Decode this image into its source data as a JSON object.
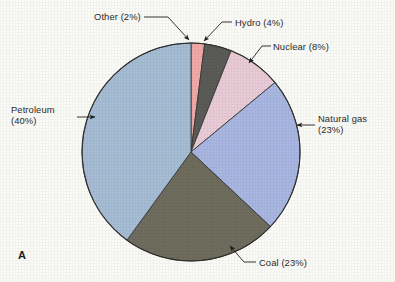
{
  "figure": {
    "letter": "A",
    "background_color": "#fbfbf7",
    "text_color": "#2b2b2b"
  },
  "chart_data": {
    "type": "pie",
    "title": "",
    "subtitle": "",
    "xlabel": "",
    "ylabel": "",
    "legend_position": "none",
    "grid": false,
    "units": "percent",
    "start_angle_deg": 0,
    "direction": "clockwise",
    "center": {
      "x": 191,
      "y": 152
    },
    "radius": 109,
    "categories": [
      "Other",
      "Hydro",
      "Nuclear",
      "Natural gas",
      "Coal",
      "Petroleum"
    ],
    "values": [
      2,
      4,
      8,
      23,
      23,
      40
    ],
    "colors": [
      "#f2a9a7",
      "#5b5b58",
      "#e9ccd7",
      "#a9b7e2",
      "#6e6d5e",
      "#a6bdd5"
    ],
    "slices": [
      {
        "label": "Other",
        "percent": 2,
        "color": "#f2a9a7"
      },
      {
        "label": "Hydro",
        "percent": 4,
        "color": "#5b5b58"
      },
      {
        "label": "Nuclear",
        "percent": 8,
        "color": "#e9ccd7"
      },
      {
        "label": "Natural gas",
        "percent": 23,
        "color": "#a9b7e2"
      },
      {
        "label": "Coal",
        "percent": 23,
        "color": "#6e6d5e"
      },
      {
        "label": "Petroleum",
        "percent": 40,
        "color": "#a6bdd5"
      }
    ]
  },
  "labels": {
    "petroleum_line1": "Petroleum",
    "petroleum_line2": "(40%)",
    "other": "Other (2%)",
    "hydro": "Hydro (4%)",
    "nuclear": "Nuclear (8%)",
    "natural_gas_line1": "Natural gas",
    "natural_gas_line2": "(23%)",
    "coal": "Coal (23%)"
  }
}
